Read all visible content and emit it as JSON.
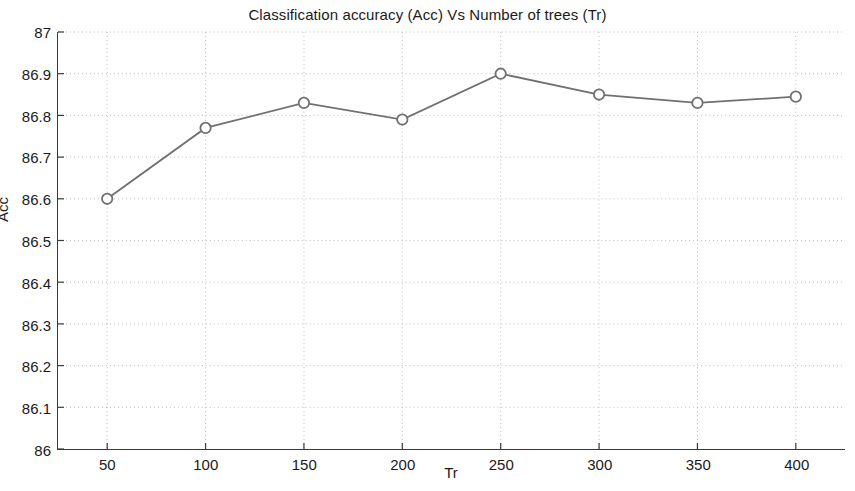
{
  "chart_data": {
    "type": "line",
    "title": "Classification accuracy (Acc) Vs Number of trees (Tr)",
    "xlabel": "Tr",
    "ylabel": "Acc",
    "x": [
      50,
      100,
      150,
      200,
      250,
      300,
      350,
      400
    ],
    "values": [
      86.6,
      86.77,
      86.83,
      86.79,
      86.9,
      86.85,
      86.83,
      86.845
    ],
    "xtick_labels": [
      "50",
      "100",
      "150",
      "200",
      "250",
      "300",
      "350",
      "400"
    ],
    "ytick_labels": [
      "86",
      "86.1",
      "86.2",
      "86.3",
      "86.4",
      "86.5",
      "86.6",
      "86.7",
      "86.8",
      "86.9",
      "87"
    ],
    "yticks": [
      86,
      86.1,
      86.2,
      86.3,
      86.4,
      86.5,
      86.6,
      86.7,
      86.8,
      86.9,
      87
    ],
    "xlim": [
      25,
      425
    ],
    "ylim": [
      86,
      87
    ],
    "grid": true,
    "legend": null,
    "series_color": "#707070",
    "marker": "circle-open",
    "grid_color": "#bdbdbd",
    "axis_color": "#3a3a3a"
  }
}
